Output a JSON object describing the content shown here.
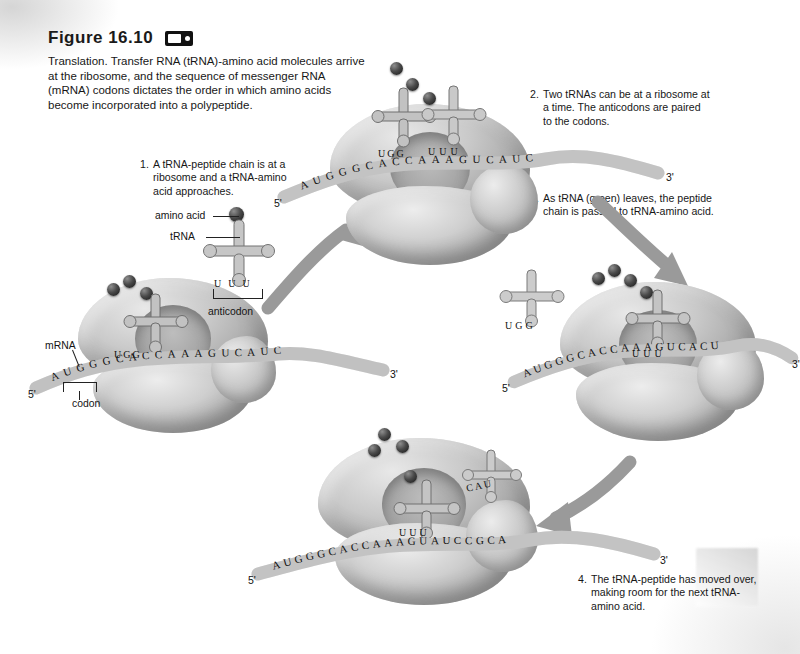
{
  "figure": {
    "number": "Figure 16.10",
    "media_icon": "video-icon",
    "caption": "Translation. Transfer RNA (tRNA)-amino acid molecules arrive at the ribosome, and the sequence of messenger RNA (mRNA) codons dictates the order in which amino acids become incorporated into a polypeptide."
  },
  "steps": [
    {
      "num": "1.",
      "text": "A tRNA-peptide chain is at a ribosome and a tRNA-amino acid approaches."
    },
    {
      "num": "2.",
      "text": "Two tRNAs can be at a ribosome at a time. The anticodons are paired to the codons."
    },
    {
      "num": "3.",
      "text": "As tRNA (green) leaves, the peptide chain is passed to tRNA-amino acid."
    },
    {
      "num": "4.",
      "text": "The tRNA-peptide has moved over, making room for the next tRNA-amino acid."
    }
  ],
  "labels": {
    "amino_acid": "amino acid",
    "trna": "tRNA",
    "anticodon": "anticodon",
    "mrna": "mRNA",
    "codon": "codon"
  },
  "panels": [
    {
      "id": "panel-1",
      "name": "ribosome-stage-1",
      "mrna_five_prime": "5'",
      "mrna_three_prime": "3'",
      "mrna_sequence": "AUGGGCACCAAAGUCAUC",
      "bound_anticodons": [
        "UGG"
      ],
      "free_anticodon": "UUU",
      "peptide_beads": 3
    },
    {
      "id": "panel-2",
      "name": "ribosome-stage-2",
      "mrna_five_prime": "5'",
      "mrna_three_prime": "3'",
      "mrna_sequence": "AUGGGCACCAAAGUCAUC",
      "bound_anticodons": [
        "UGG",
        "UUU"
      ],
      "peptide_beads": 3
    },
    {
      "id": "panel-3",
      "name": "ribosome-stage-3",
      "mrna_five_prime": "5'",
      "mrna_three_prime": "3'",
      "mrna_sequence": "AUGGGCACCAAAGUCACU",
      "bound_anticodons": [
        "UUU"
      ],
      "departing_anticodon": "UGG",
      "peptide_beads": 4
    },
    {
      "id": "panel-4",
      "name": "ribosome-stage-4",
      "mrna_five_prime": "5'",
      "mrna_three_prime": "3'",
      "mrna_sequence": "AUGGGCACCAAAGUAUCCGCA",
      "bound_anticodons": [
        "UUU",
        "CAU"
      ],
      "peptide_beads": 4
    }
  ],
  "colors": {
    "ink": "#141414",
    "page": "#ffffff",
    "structure_mid": "#b4b4b4",
    "structure_dark": "#8d8d8d",
    "arrow": "#9a9a9a"
  }
}
